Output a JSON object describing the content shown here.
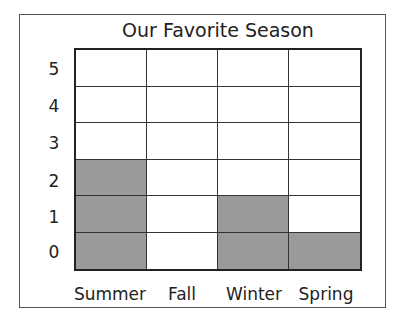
{
  "chart_data": {
    "type": "bar",
    "title": "Our Favorite Season",
    "categories": [
      "Summer",
      "Fall",
      "Winter",
      "Spring"
    ],
    "values": [
      3,
      0,
      2,
      1
    ],
    "y_tick_labels": [
      "5",
      "4",
      "3",
      "2",
      "1",
      "0"
    ],
    "xlabel": "",
    "ylabel": "",
    "ylim": [
      0,
      6
    ],
    "grid": true,
    "fill_color": "#9a9a9a",
    "note": "Pictograph-style grid: each shaded cell counts as one; row labels 0-5 mark the cells from bottom to top"
  }
}
